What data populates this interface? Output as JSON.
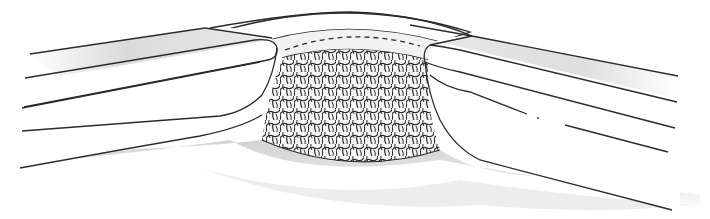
{
  "figure": {
    "type": "illustration",
    "text_labels": [],
    "colors": {
      "background": "#ffffff",
      "line": "#2b2b2b",
      "shade": "#d9d9d9",
      "shade_dark": "#bdbdbd",
      "mesh_fill": "#f4f4f4"
    },
    "parts": {
      "left_flap": "left-tissue-flap",
      "right_flap": "right-tissue-flap",
      "bridge_layer": "overlying-fascia-layer",
      "suture_line": "dashed-suture-line",
      "mesh": "mesh-implant",
      "floor": "shaded-underlying-floor"
    }
  }
}
